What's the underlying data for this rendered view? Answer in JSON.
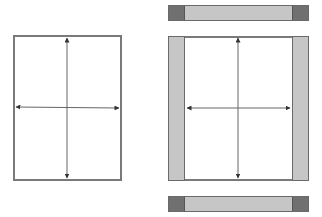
{
  "diagram": {
    "colors": {
      "frame": "#7a7a7a",
      "strip_light": "#c6c6c6",
      "strip_dark": "#707070",
      "arrow": "#555555",
      "background": "#ffffff"
    },
    "left_page": {
      "x": 13,
      "y": 35,
      "w": 109,
      "h": 146,
      "arrows": [
        "up",
        "down",
        "left",
        "right"
      ]
    },
    "right_page": {
      "x": 168,
      "y": 36,
      "w": 141,
      "h": 145,
      "side_strip_width": 16,
      "arrows": [
        "up",
        "down",
        "left",
        "right"
      ]
    },
    "top_bar": {
      "x": 168,
      "y": 5,
      "w": 141,
      "h": 16,
      "cap_width": 15
    },
    "bottom_bar": {
      "x": 168,
      "y": 196,
      "w": 141,
      "h": 16,
      "cap_width": 15
    }
  }
}
